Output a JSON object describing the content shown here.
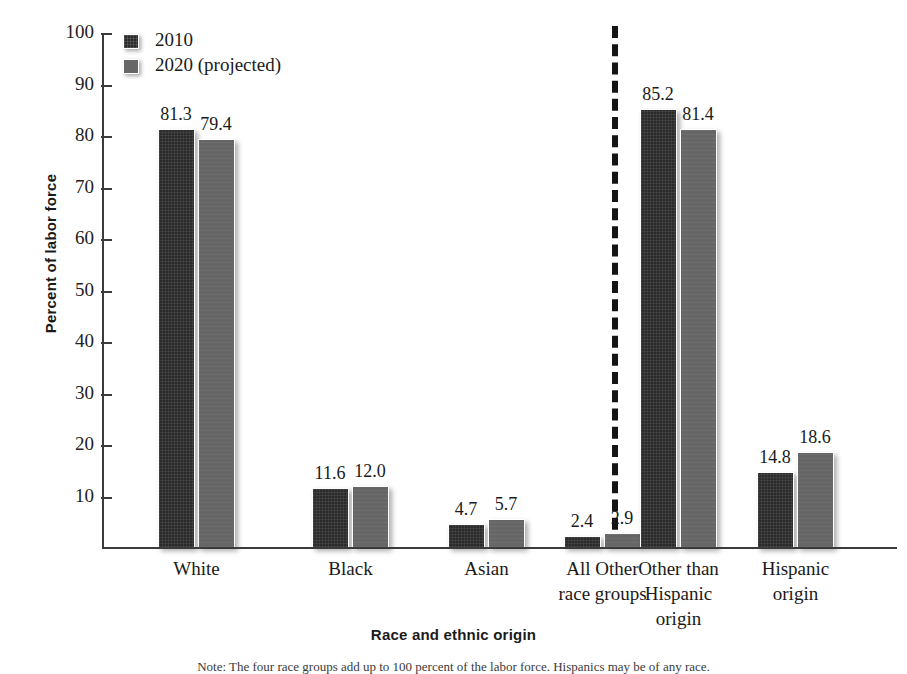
{
  "chart_data": {
    "type": "bar",
    "title": "",
    "xlabel": "Race and ethnic origin",
    "ylabel": "Percent of labor force",
    "ylim": [
      0,
      100
    ],
    "yticks": [
      10,
      20,
      30,
      40,
      50,
      60,
      70,
      80,
      90,
      100
    ],
    "grid": false,
    "legend_position": "top-left",
    "categories": [
      "White",
      "Black",
      "Asian",
      "All Other race groups",
      "Other than Hispanic origin",
      "Hispanic origin"
    ],
    "category_lines": [
      [
        "White"
      ],
      [
        "Black"
      ],
      [
        "Asian"
      ],
      [
        "All Other",
        "race groups"
      ],
      [
        "Other than",
        "Hispanic",
        "origin"
      ],
      [
        "Hispanic",
        "origin"
      ]
    ],
    "series": [
      {
        "name": "2010",
        "color": "#2b2b2b",
        "values": [
          81.3,
          11.6,
          4.7,
          2.4,
          85.2,
          14.8
        ],
        "labels": [
          "81.3",
          "11.6",
          "4.7",
          "2.4",
          "85.2",
          "14.8"
        ]
      },
      {
        "name": "2020 (projected)",
        "color": "#666666",
        "values": [
          79.4,
          12.0,
          5.7,
          2.9,
          81.4,
          18.6
        ],
        "labels": [
          "79.4",
          "12.0",
          "5.7",
          "2.9",
          "81.4",
          "18.6"
        ]
      }
    ],
    "annotations": [
      {
        "type": "vertical-dashed-divider",
        "after_category_index": 3,
        "note": "separates race groups from ethnic origin groups"
      }
    ],
    "footnote": "Note: The four race groups add up to 100 percent of the labor force. Hispanics may be of any race."
  },
  "legend": {
    "items": [
      {
        "label": "2010",
        "swatch": "dark-swatch-icon"
      },
      {
        "label": "2020 (projected)",
        "swatch": "gray-swatch-icon"
      }
    ]
  }
}
